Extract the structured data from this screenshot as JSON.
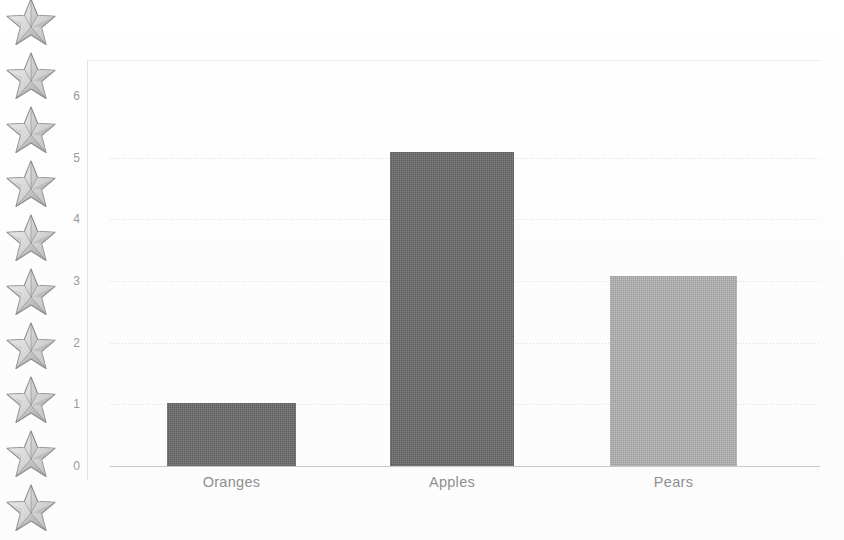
{
  "page": {
    "background_color": "#fefefe",
    "width": 844,
    "height": 540
  },
  "decoration": {
    "star_icon_name": "star-icon",
    "star_count": 10,
    "star_color": "#b8b8b8",
    "star_outline_color": "#8a8a8a",
    "star_vertical_spacing": 54,
    "star_first_top": -6
  },
  "chart_data": {
    "type": "bar",
    "title": "",
    "subtitle": "",
    "xlabel": "",
    "ylabel": "",
    "categories": [
      "Oranges",
      "Apples",
      "Pears"
    ],
    "values": [
      1,
      5,
      3
    ],
    "bar_colors": [
      "#6b6b6b",
      "#6b6b6b",
      "#aeaeae"
    ],
    "ylim": [
      0,
      6
    ],
    "yticks": [
      0,
      1,
      2,
      3,
      4,
      5,
      6
    ],
    "ytick_labels": [
      "0",
      "1",
      "2",
      "3",
      "4",
      "5",
      "6"
    ],
    "grid": true,
    "grid_axis": "y",
    "grid_style": "dotted",
    "grid_color": "#d6d6d6",
    "legend": false,
    "legend_position": "none",
    "axis_color": "#c9c9c9",
    "tick_label_color": "#9a9a9a",
    "category_label_color": "#8f8f8f",
    "annotations": []
  },
  "geometry": {
    "plot_left": 87,
    "plot_top": 60,
    "plot_right": 820,
    "baseline_y": 466,
    "unit_height": 61.7,
    "bars": [
      {
        "name": "Oranges",
        "left": 167,
        "width": 129,
        "top": 403
      },
      {
        "name": "Apples",
        "left": 390,
        "width": 124,
        "top": 152
      },
      {
        "name": "Pears",
        "left": 610,
        "width": 127,
        "top": 276
      }
    ]
  }
}
